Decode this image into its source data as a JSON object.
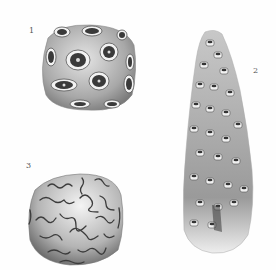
{
  "plate": {
    "figures": [
      {
        "number": "1",
        "description": "Rounded coral colony with circular star-shaped corallites"
      },
      {
        "number": "2",
        "description": "Tall columnar/conical coral with crowded cup-like corallites"
      },
      {
        "number": "3",
        "description": "Brain coral with meandering sinuous grooves"
      }
    ],
    "colors": {
      "background": "#ffffff",
      "ink": "#4a4a4a",
      "shade": "#9a9a9a",
      "light": "#d8d8d8"
    }
  }
}
